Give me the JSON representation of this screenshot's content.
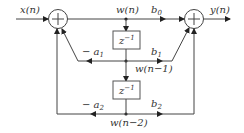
{
  "diagram": {
    "type": "Direct Form II biquad IIR filter block diagram",
    "input": {
      "label": "x(n)"
    },
    "output": {
      "label": "y(n)"
    },
    "nodes": {
      "w0": {
        "label": "w(n)"
      },
      "w1": {
        "label": "w(n−1)"
      },
      "w2": {
        "label": "w(n−2)"
      }
    },
    "delays": [
      {
        "label": "z",
        "exp": "−1"
      },
      {
        "label": "z",
        "exp": "−1"
      }
    ],
    "coefficients": {
      "b0": {
        "base": "b",
        "sub": "0"
      },
      "b1": {
        "base": "b",
        "sub": "1"
      },
      "b2": {
        "base": "b",
        "sub": "2"
      },
      "a1": {
        "prefix": "− ",
        "base": "a",
        "sub": "1"
      },
      "a2": {
        "prefix": "− ",
        "base": "a",
        "sub": "2"
      }
    },
    "adders": [
      "left-summing-junction",
      "right-summing-junction"
    ],
    "colors": {
      "line": "#444444",
      "text": "#333333",
      "background": "#ffffff"
    }
  }
}
